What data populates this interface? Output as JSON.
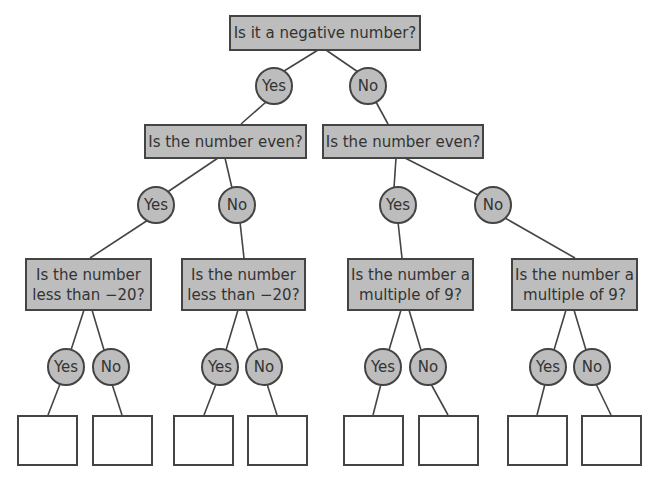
{
  "diagram": {
    "type": "decision-tree",
    "root": {
      "question": "Is it a negative number?"
    },
    "level1": [
      {
        "answer": "Yes",
        "question": "Is the number even?"
      },
      {
        "answer": "No",
        "question": "Is the number even?"
      }
    ],
    "level2": [
      {
        "answer": "Yes",
        "question_line1": "Is the number",
        "question_line2": "less than −20?"
      },
      {
        "answer": "No",
        "question_line1": "Is the number",
        "question_line2": "less than −20?"
      },
      {
        "answer": "Yes",
        "question_line1": "Is the number a",
        "question_line2": "multiple of 9?"
      },
      {
        "answer": "No",
        "question_line1": "Is the number a",
        "question_line2": "multiple of 9?"
      }
    ],
    "level3_answers": [
      "Yes",
      "No",
      "Yes",
      "No",
      "Yes",
      "No",
      "Yes",
      "No"
    ],
    "leaves": [
      "",
      "",
      "",
      "",
      "",
      "",
      "",
      ""
    ],
    "colors": {
      "node_fill": "#bdbdbd",
      "stroke": "#444444",
      "leaf_fill": "#ffffff"
    }
  }
}
